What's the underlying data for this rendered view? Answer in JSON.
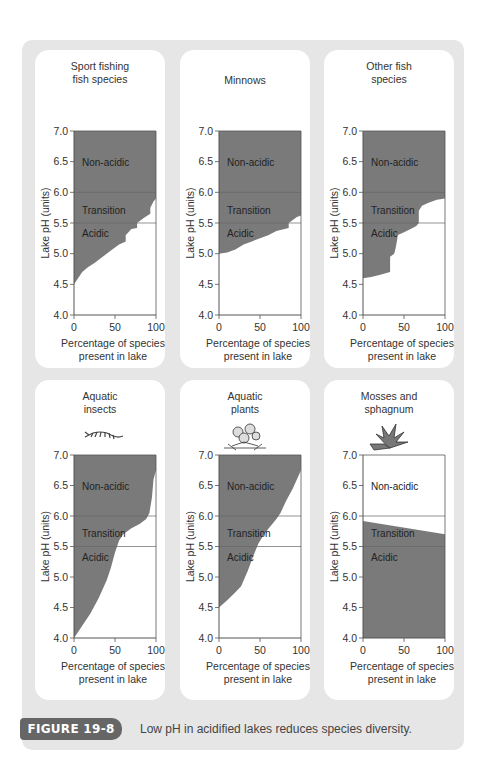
{
  "figure": {
    "label": "FIGURE 19-8",
    "caption": "Low pH in acidified lakes reduces species diversity.",
    "colors": {
      "frame": "#e6e6e6",
      "panel": "#ffffff",
      "fill": "#7a7a7a",
      "badge": "#666666",
      "axis": "#555555",
      "band_line": "#666666"
    }
  },
  "chart_data": [
    {
      "type": "area",
      "title": "Sport fishing fish species",
      "icon": "sport-fish-icon",
      "xlabel": "Percentage of species present in lake",
      "ylabel": "Lake pH (units)",
      "xlim": [
        0,
        100
      ],
      "ylim": [
        4.0,
        7.0
      ],
      "xticks": [
        0,
        50,
        100
      ],
      "yticks": [
        4.0,
        4.5,
        5.0,
        5.5,
        6.0,
        6.5,
        7.0
      ],
      "bands": [
        {
          "label": "Non-acidic",
          "from": 6.0,
          "to": 7.0
        },
        {
          "label": "Transition",
          "from": 5.5,
          "to": 6.0
        },
        {
          "label": "Acidic",
          "from": 4.0,
          "to": 5.5
        }
      ],
      "boundary": {
        "x": [
          0,
          5,
          10,
          17,
          25,
          35,
          45,
          55,
          63,
          63,
          70,
          77,
          77,
          85,
          93,
          93,
          97,
          100
        ],
        "y": [
          4.5,
          4.6,
          4.7,
          4.78,
          4.85,
          4.95,
          5.05,
          5.15,
          5.2,
          5.3,
          5.4,
          5.42,
          5.5,
          5.58,
          5.65,
          5.75,
          5.85,
          5.9
        ]
      },
      "shading": "above"
    },
    {
      "type": "area",
      "title": "Minnows",
      "icon": "minnow-icon",
      "xlabel": "Percentage of species present in lake",
      "ylabel": "Lake pH (units)",
      "xlim": [
        0,
        100
      ],
      "ylim": [
        4.0,
        7.0
      ],
      "xticks": [
        0,
        50,
        100
      ],
      "yticks": [
        4.0,
        4.5,
        5.0,
        5.5,
        6.0,
        6.5,
        7.0
      ],
      "bands": [
        {
          "label": "Non-acidic",
          "from": 6.0,
          "to": 7.0
        },
        {
          "label": "Transition",
          "from": 5.5,
          "to": 6.0
        },
        {
          "label": "Acidic",
          "from": 4.0,
          "to": 5.5
        }
      ],
      "boundary": {
        "x": [
          0,
          10,
          20,
          30,
          40,
          50,
          60,
          70,
          80,
          85,
          85,
          90,
          95,
          100
        ],
        "y": [
          5.0,
          5.02,
          5.07,
          5.15,
          5.2,
          5.25,
          5.3,
          5.37,
          5.4,
          5.42,
          5.5,
          5.55,
          5.6,
          5.62
        ]
      },
      "shading": "above"
    },
    {
      "type": "area",
      "title": "Other fish species",
      "icon": "other-fish-icon",
      "xlabel": "Percentage of species present in lake",
      "ylabel": "Lake pH (units)",
      "xlim": [
        0,
        100
      ],
      "ylim": [
        4.0,
        7.0
      ],
      "xticks": [
        0,
        50,
        100
      ],
      "yticks": [
        4.0,
        4.5,
        5.0,
        5.5,
        6.0,
        6.5,
        7.0
      ],
      "bands": [
        {
          "label": "Non-acidic",
          "from": 6.0,
          "to": 7.0
        },
        {
          "label": "Transition",
          "from": 5.5,
          "to": 6.0
        },
        {
          "label": "Acidic",
          "from": 4.0,
          "to": 5.5
        }
      ],
      "boundary": {
        "x": [
          0,
          10,
          20,
          33,
          33,
          38,
          40,
          42,
          42,
          50,
          58,
          65,
          68,
          68,
          72,
          80,
          90,
          100
        ],
        "y": [
          4.6,
          4.62,
          4.65,
          4.7,
          4.95,
          5.0,
          5.1,
          5.25,
          5.3,
          5.35,
          5.4,
          5.45,
          5.5,
          5.7,
          5.78,
          5.83,
          5.88,
          5.9
        ]
      },
      "shading": "above"
    },
    {
      "type": "area",
      "title": "Aquatic insects",
      "icon": "insect-icon",
      "xlabel": "Percentage of species present in lake",
      "ylabel": "Lake pH (units)",
      "xlim": [
        0,
        100
      ],
      "ylim": [
        4.0,
        7.0
      ],
      "xticks": [
        0,
        50,
        100
      ],
      "yticks": [
        4.0,
        4.5,
        5.0,
        5.5,
        6.0,
        6.5,
        7.0
      ],
      "bands": [
        {
          "label": "Non-acidic",
          "from": 6.0,
          "to": 7.0
        },
        {
          "label": "Transition",
          "from": 5.5,
          "to": 6.0
        },
        {
          "label": "Acidic",
          "from": 4.0,
          "to": 5.5
        }
      ],
      "boundary": {
        "x": [
          0,
          10,
          20,
          30,
          40,
          45,
          50,
          55,
          60,
          70,
          80,
          88,
          92,
          95,
          97,
          100
        ],
        "y": [
          4.0,
          4.2,
          4.4,
          4.65,
          4.95,
          5.15,
          5.4,
          5.6,
          5.7,
          5.8,
          5.87,
          5.95,
          6.05,
          6.3,
          6.6,
          6.75
        ]
      },
      "shading": "above"
    },
    {
      "type": "area",
      "title": "Aquatic plants",
      "icon": "plant-icon",
      "xlabel": "Percentage of species present in lake",
      "ylabel": "Lake pH (units)",
      "xlim": [
        0,
        100
      ],
      "ylim": [
        4.0,
        7.0
      ],
      "xticks": [
        0,
        50,
        100
      ],
      "yticks": [
        4.0,
        4.5,
        5.0,
        5.5,
        6.0,
        6.5,
        7.0
      ],
      "bands": [
        {
          "label": "Non-acidic",
          "from": 6.0,
          "to": 7.0
        },
        {
          "label": "Transition",
          "from": 5.5,
          "to": 6.0
        },
        {
          "label": "Acidic",
          "from": 4.0,
          "to": 5.5
        }
      ],
      "boundary": {
        "x": [
          0,
          10,
          20,
          27,
          35,
          42,
          48,
          55,
          62,
          70,
          75,
          82,
          90,
          100
        ],
        "y": [
          4.5,
          4.62,
          4.75,
          4.85,
          5.1,
          5.35,
          5.55,
          5.7,
          5.82,
          5.95,
          6.05,
          6.25,
          6.45,
          6.75
        ]
      },
      "shading": "above"
    },
    {
      "type": "area",
      "title": "Mosses and sphagnum",
      "icon": "moss-icon",
      "xlabel": "Percentage of species present in lake",
      "ylabel": "Lake pH (units)",
      "xlim": [
        0,
        100
      ],
      "ylim": [
        4.0,
        7.0
      ],
      "xticks": [
        0,
        50,
        100
      ],
      "yticks": [
        4.0,
        4.5,
        5.0,
        5.5,
        6.0,
        6.5,
        7.0
      ],
      "bands": [
        {
          "label": "Non-acidic",
          "from": 6.0,
          "to": 7.0
        },
        {
          "label": "Transition",
          "from": 5.5,
          "to": 6.0
        },
        {
          "label": "Acidic",
          "from": 4.0,
          "to": 5.5
        }
      ],
      "boundary": {
        "x": [
          0,
          100
        ],
        "y": [
          5.92,
          5.7
        ]
      },
      "shading": "below"
    }
  ],
  "panels": [
    {
      "title": "Sport fishing\nfish species"
    },
    {
      "title": "Minnows"
    },
    {
      "title": "Other fish\nspecies"
    },
    {
      "title": "Aquatic\ninsects"
    },
    {
      "title": "Aquatic\nplants"
    },
    {
      "title": "Mosses and\nsphagnum"
    }
  ],
  "axis_text": {
    "ylabel": "Lake pH (units)",
    "xlabel_line1": "Percentage of species",
    "xlabel_line2": "present in lake",
    "yticks": [
      "4.0",
      "4.5",
      "5.0",
      "5.5",
      "6.0",
      "6.5",
      "7.0"
    ],
    "xticks": [
      "0",
      "50",
      "100"
    ],
    "band_labels": [
      "Non-acidic",
      "Transition",
      "Acidic"
    ]
  }
}
